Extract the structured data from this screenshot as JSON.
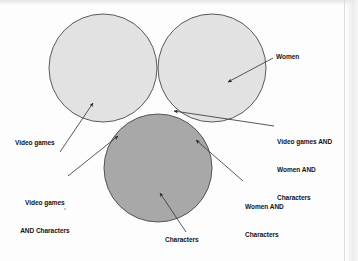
{
  "figure": {
    "type": "venn-diagram",
    "set_count": 3,
    "background_color": "#fdfdfd"
  },
  "diagram": {
    "circles": [
      {
        "id": "video-games",
        "label": "Video games",
        "cx": 103,
        "cy": 68,
        "r": 54,
        "fill": "#e2e2e2",
        "stroke": "#4a4a4a",
        "layer": 1
      },
      {
        "id": "women",
        "label": "Women",
        "cx": 212,
        "cy": 68,
        "r": 54,
        "fill": "#e2e2e2",
        "stroke": "#4a4a4a",
        "layer": 2
      },
      {
        "id": "characters",
        "label": "Characters",
        "cx": 158,
        "cy": 168,
        "r": 54,
        "fill": "#a8a8a8",
        "stroke": "#4a4a4a",
        "layer": 3
      }
    ]
  },
  "labels": {
    "women": {
      "text": "Women",
      "lines": [
        "Women"
      ],
      "target": "women-circle-solo-region"
    },
    "triple": {
      "text": "Video games AND Women AND Characters",
      "lines": [
        "Video games AND",
        "Women AND",
        "Characters"
      ],
      "target": "triple-intersection"
    },
    "video_games": {
      "text": "Video games",
      "lines": [
        "Video games"
      ],
      "target": "video-games-circle-solo-region"
    },
    "video_games_and_characters": {
      "text": "Video games AND Characters",
      "lines": [
        "Video games",
        "AND Characters"
      ],
      "target": "video-games-characters-intersection"
    },
    "women_and_characters": {
      "text": "Women AND Characters",
      "lines": [
        "Women AND",
        "Characters"
      ],
      "target": "women-characters-intersection"
    },
    "characters": {
      "text": "Characters",
      "lines": [
        "Characters"
      ],
      "target": "characters-circle-solo-region"
    }
  },
  "leaders": {
    "stroke": "#3a3a3a",
    "arrowhead": "solid-triangle"
  }
}
